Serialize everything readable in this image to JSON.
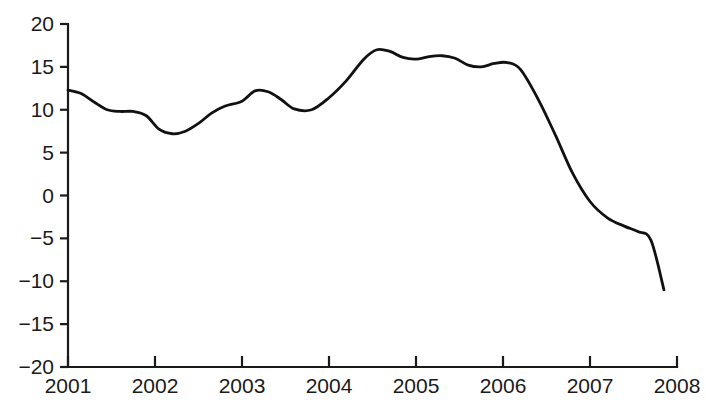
{
  "chart_data": {
    "type": "line",
    "title": "",
    "subtitle": "",
    "xlabel": "",
    "ylabel": "",
    "xlim": [
      2001,
      2008
    ],
    "ylim": [
      -20,
      20
    ],
    "grid": false,
    "legend": null,
    "legend_position": "none",
    "line_color": "#111111",
    "axis_color": "#1a1a1a",
    "background_color": "#ffffff",
    "x_tick_labels": [
      "2001",
      "2002",
      "2003",
      "2004",
      "2005",
      "2006",
      "2007",
      "2008"
    ],
    "x_tick_values": [
      2001,
      2002,
      2003,
      2004,
      2005,
      2006,
      2007,
      2008
    ],
    "y_tick_labels": [
      "20",
      "15",
      "10",
      "5",
      "0",
      "−5",
      "−10",
      "−15",
      "−20"
    ],
    "y_tick_values": [
      20,
      15,
      10,
      5,
      0,
      -5,
      -10,
      -15,
      -20
    ],
    "series": [
      {
        "name": "series-1",
        "x": [
          2001.0,
          2001.15,
          2001.3,
          2001.45,
          2001.6,
          2001.75,
          2001.9,
          2002.05,
          2002.2,
          2002.35,
          2002.5,
          2002.65,
          2002.8,
          2003.0,
          2003.15,
          2003.3,
          2003.45,
          2003.6,
          2003.8,
          2004.0,
          2004.2,
          2004.4,
          2004.55,
          2004.7,
          2004.85,
          2005.0,
          2005.15,
          2005.3,
          2005.45,
          2005.6,
          2005.75,
          2005.9,
          2006.05,
          2006.2,
          2006.4,
          2006.6,
          2006.8,
          2007.0,
          2007.2,
          2007.4,
          2007.55,
          2007.7,
          2007.85
        ],
        "y": [
          12.3,
          11.9,
          10.9,
          10.0,
          9.8,
          9.8,
          9.3,
          7.7,
          7.2,
          7.5,
          8.4,
          9.6,
          10.4,
          11.0,
          12.2,
          12.1,
          11.2,
          10.1,
          10.0,
          11.4,
          13.4,
          15.9,
          17.0,
          16.8,
          16.1,
          15.9,
          16.2,
          16.3,
          16.0,
          15.2,
          15.0,
          15.4,
          15.5,
          14.7,
          11.3,
          7.1,
          2.6,
          -0.7,
          -2.6,
          -3.6,
          -4.2,
          -5.2,
          -11.0
        ]
      }
    ]
  },
  "axes": {
    "plot_left_px": 68,
    "plot_right_px": 677,
    "plot_top_px": 24,
    "plot_bottom_px": 367
  }
}
